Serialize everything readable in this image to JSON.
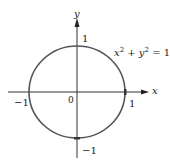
{
  "diagram": {
    "equation": {
      "x": "x",
      "y": "y",
      "exp": "2",
      "plus": " + ",
      "rhs": " = 1"
    },
    "axes": {
      "x_label": "x",
      "y_label": "y"
    },
    "ticks": {
      "x_neg": "−1",
      "x_pos": "1",
      "origin": "0",
      "y_pos": "1",
      "y_neg": "−1"
    },
    "colors": {
      "circle": "#555555",
      "axis": "#333333",
      "text": "#222222"
    },
    "geometry": {
      "origin": [
        77,
        92
      ],
      "radius_x": 48,
      "radius_y": 46
    }
  }
}
